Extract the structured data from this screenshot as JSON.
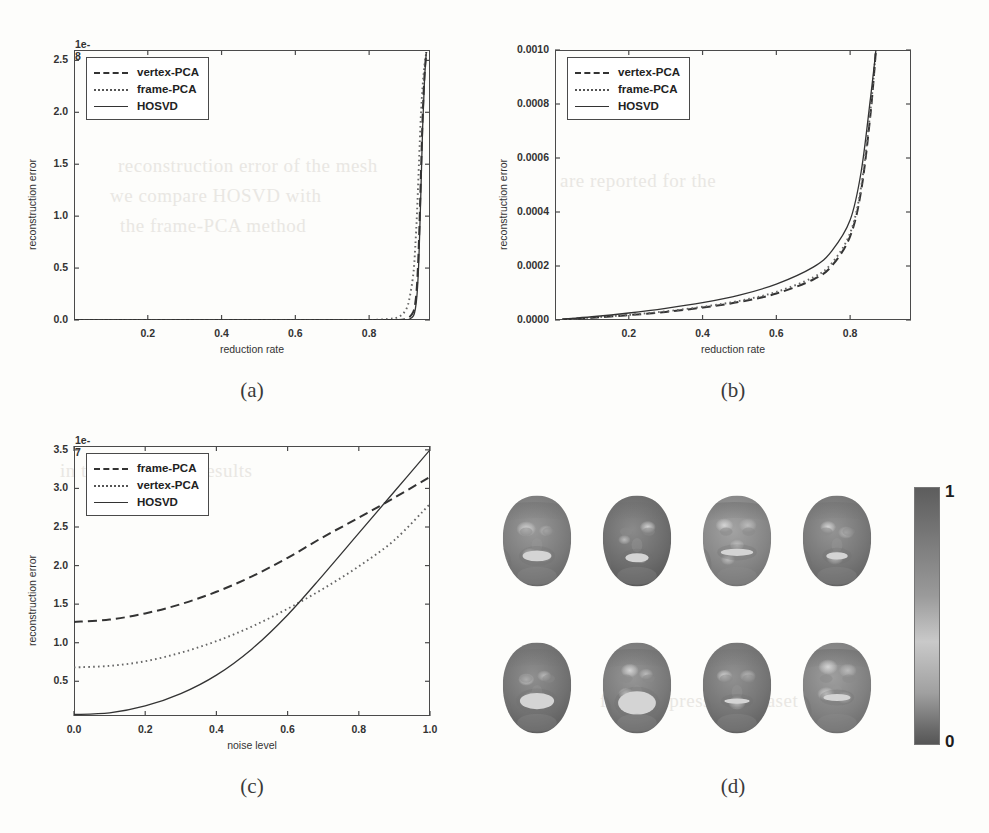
{
  "page": {
    "bleed_texts": [
      "reconstruction error of the mesh",
      "we compare HOSVD with",
      "the frame-PCA method",
      "in this figure the results",
      "are reported for the",
      "facial expression dataset"
    ]
  },
  "panels": [
    {
      "id": "a",
      "caption": "(a)",
      "xlabel": "reduction rate",
      "ylabel": "reconstruction error",
      "offset_text": "1e-8",
      "xticks": [
        "0.2",
        "0.4",
        "0.6",
        "0.8"
      ],
      "xtick_values": [
        0.2,
        0.4,
        0.6,
        0.8
      ],
      "yticks": [
        "0.0",
        "0.5",
        "1.0",
        "1.5",
        "2.0",
        "2.5"
      ],
      "ytick_values": [
        0.0,
        0.5,
        1.0,
        1.5,
        2.0,
        2.5
      ],
      "legend": [
        {
          "label": "vertex-PCA",
          "style": "dashed"
        },
        {
          "label": "frame-PCA",
          "style": "dotted"
        },
        {
          "label": "HOSVD",
          "style": "solid"
        }
      ]
    },
    {
      "id": "b",
      "caption": "(b)",
      "xlabel": "reduction rate",
      "ylabel": "reconstruction error",
      "offset_text": "",
      "xticks": [
        "0.2",
        "0.4",
        "0.6",
        "0.8"
      ],
      "xtick_values": [
        0.2,
        0.4,
        0.6,
        0.8
      ],
      "yticks": [
        "0.0000",
        "0.0002",
        "0.0004",
        "0.0006",
        "0.0008",
        "0.0010"
      ],
      "ytick_values": [
        0.0,
        0.0002,
        0.0004,
        0.0006,
        0.0008,
        0.001
      ],
      "legend": [
        {
          "label": "vertex-PCA",
          "style": "dashed"
        },
        {
          "label": "frame-PCA",
          "style": "dotted"
        },
        {
          "label": "HOSVD",
          "style": "solid"
        }
      ]
    },
    {
      "id": "c",
      "caption": "(c)",
      "xlabel": "noise level",
      "ylabel": "reconstruction error",
      "offset_text": "1e-7",
      "xticks": [
        "0.0",
        "0.2",
        "0.4",
        "0.6",
        "0.8",
        "1.0"
      ],
      "xtick_values": [
        0.0,
        0.2,
        0.4,
        0.6,
        0.8,
        1.0
      ],
      "yticks": [
        "0.5",
        "1.0",
        "1.5",
        "2.0",
        "2.5",
        "3.0",
        "3.5"
      ],
      "ytick_values": [
        0.5,
        1.0,
        1.5,
        2.0,
        2.5,
        3.0,
        3.5
      ],
      "legend": [
        {
          "label": "frame-PCA",
          "style": "dashed"
        },
        {
          "label": "vertex-PCA",
          "style": "dotted"
        },
        {
          "label": "HOSVD",
          "style": "solid"
        }
      ]
    },
    {
      "id": "d",
      "caption": "(d)",
      "colorbar": {
        "max_label": "1",
        "min_label": "0"
      },
      "face_count": 8
    }
  ],
  "chart_data": [
    {
      "panel": "a",
      "type": "line",
      "title": "",
      "xlabel": "reduction rate",
      "ylabel": "reconstruction error",
      "y_offset_exponent": "1e-8",
      "xlim": [
        0.0,
        0.965
      ],
      "ylim": [
        0.0,
        2.6
      ],
      "grid": false,
      "legend_position": "upper left",
      "x": [
        0.0,
        0.1,
        0.2,
        0.3,
        0.4,
        0.5,
        0.6,
        0.7,
        0.8,
        0.85,
        0.88,
        0.9,
        0.91,
        0.92,
        0.925,
        0.93,
        0.935,
        0.94,
        0.945,
        0.95,
        0.955
      ],
      "series": [
        {
          "name": "vertex-PCA",
          "style": "dashed",
          "values": [
            0.0,
            0.0,
            0.0,
            0.0,
            0.0,
            0.0,
            0.0,
            0.0,
            0.0,
            0.0,
            0.0,
            0.01,
            0.03,
            0.08,
            0.16,
            0.35,
            0.75,
            1.35,
            1.95,
            2.35,
            2.58
          ]
        },
        {
          "name": "frame-PCA",
          "style": "dotted",
          "values": [
            0.0,
            0.0,
            0.0,
            0.0,
            0.0,
            0.0,
            0.0,
            0.0,
            0.0,
            0.01,
            0.03,
            0.1,
            0.22,
            0.45,
            0.7,
            1.05,
            1.5,
            1.95,
            2.25,
            2.45,
            2.58
          ]
        },
        {
          "name": "HOSVD",
          "style": "solid",
          "values": [
            0.0,
            0.0,
            0.0,
            0.0,
            0.0,
            0.0,
            0.0,
            0.0,
            0.0,
            0.0,
            0.0,
            0.0,
            0.01,
            0.04,
            0.1,
            0.25,
            0.6,
            1.2,
            1.85,
            2.3,
            2.58
          ]
        }
      ]
    },
    {
      "panel": "b",
      "type": "line",
      "title": "",
      "xlabel": "reduction rate",
      "ylabel": "reconstruction error",
      "y_offset_exponent": "1",
      "xlim": [
        0.0,
        0.965
      ],
      "ylim": [
        0.0,
        0.001
      ],
      "grid": false,
      "legend_position": "upper left",
      "x": [
        0.02,
        0.1,
        0.2,
        0.3,
        0.4,
        0.5,
        0.6,
        0.7,
        0.75,
        0.8,
        0.83,
        0.855,
        0.87
      ],
      "series": [
        {
          "name": "vertex-PCA",
          "style": "dashed",
          "values": [
            2e-06,
            8e-06,
            1.8e-05,
            3e-05,
            4.6e-05,
            6.7e-05,
            9.8e-05,
            0.00015,
            0.0002,
            0.00031,
            0.00048,
            0.00076,
            0.001
          ]
        },
        {
          "name": "frame-PCA",
          "style": "dotted",
          "values": [
            2e-06,
            9e-06,
            1.9e-05,
            3.2e-05,
            4.9e-05,
            7.1e-05,
            0.000104,
            0.000158,
            0.00021,
            0.000322,
            0.000495,
            0.000775,
            0.001
          ]
        },
        {
          "name": "HOSVD",
          "style": "solid",
          "values": [
            3e-06,
            1.2e-05,
            2.6e-05,
            4.3e-05,
            6.4e-05,
            9.2e-05,
            0.000133,
            0.000196,
            0.000255,
            0.00037,
            0.00055,
            0.00082,
            0.001
          ]
        }
      ]
    },
    {
      "panel": "c",
      "type": "line",
      "title": "",
      "xlabel": "noise level",
      "ylabel": "reconstruction error",
      "y_offset_exponent": "1e-7",
      "xlim": [
        0.0,
        1.0
      ],
      "ylim": [
        0.05,
        3.55
      ],
      "grid": false,
      "legend_position": "upper left",
      "x": [
        0.0,
        0.1,
        0.2,
        0.3,
        0.4,
        0.5,
        0.6,
        0.7,
        0.8,
        0.9,
        1.0
      ],
      "series": [
        {
          "name": "frame-PCA",
          "style": "dashed",
          "values": [
            1.27,
            1.3,
            1.38,
            1.5,
            1.66,
            1.86,
            2.1,
            2.37,
            2.62,
            2.88,
            3.15
          ]
        },
        {
          "name": "vertex-PCA",
          "style": "dotted",
          "values": [
            0.68,
            0.7,
            0.76,
            0.87,
            1.02,
            1.21,
            1.44,
            1.7,
            1.99,
            2.33,
            2.8
          ]
        },
        {
          "name": "HOSVD",
          "style": "solid",
          "values": [
            0.07,
            0.09,
            0.18,
            0.34,
            0.58,
            0.92,
            1.36,
            1.88,
            2.42,
            2.96,
            3.5
          ]
        }
      ]
    },
    {
      "panel": "d",
      "type": "heatmap",
      "title": "",
      "xlabel": "",
      "ylabel": "",
      "colorbar_range": [
        0,
        1
      ],
      "colorbar_max_label": "1",
      "colorbar_min_label": "0",
      "rows": 2,
      "cols": 4,
      "description": "per-vertex reconstruction error heat maps on eight facial expression meshes"
    }
  ]
}
